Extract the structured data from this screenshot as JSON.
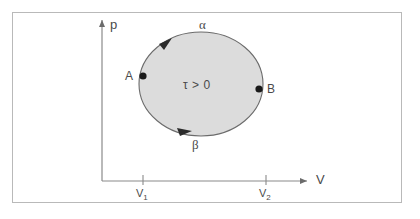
{
  "figure": {
    "type": "pv-diagram",
    "border_color": "#b9b9b9",
    "background": "#ffffff",
    "stroke_color": "#6b6b6b",
    "fill_color": "#dcdcdc"
  },
  "axes": {
    "y_label": "p",
    "x_label": "V",
    "origin": {
      "x": 102,
      "y": 181
    },
    "y_axis_top": 17,
    "x_axis_right": 314
  },
  "ticks": [
    {
      "name": "v1",
      "label": "V",
      "sub": "1",
      "x": 143
    },
    {
      "name": "v2",
      "label": "V",
      "sub": "2",
      "x": 266
    }
  ],
  "cycle": {
    "center": {
      "x": 201,
      "y": 84
    },
    "radius_x": 62,
    "radius_y": 52,
    "area_label": "τ > 0",
    "upper_path_label": "α",
    "lower_path_label": "β",
    "direction": "counterclockwise"
  },
  "points": [
    {
      "name": "A",
      "label": "A",
      "x": 143,
      "y": 76
    },
    {
      "name": "B",
      "label": "B",
      "x": 259,
      "y": 89
    }
  ]
}
